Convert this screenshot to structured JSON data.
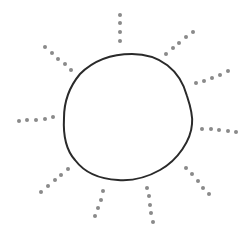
{
  "illustration": {
    "subject": "sun",
    "background": "#ffffff",
    "disc": {
      "stroke": "#2a2a2a",
      "stroke_width": 2,
      "path": "M132,54 C160,54 180,70 187,96 C191,108 193,116 192,124 C191,140 178,160 160,170 C146,178 132,181 118,180 C98,179 84,172 75,160 C66,150 63,136 64,118 C64,100 70,86 80,74 C94,60 112,54 132,54 Z"
    },
    "ray_dot_color": "#8a8a8a",
    "ray_dot_radius": 2,
    "rays": [
      {
        "name": "top",
        "dots": [
          [
            120,
            15
          ],
          [
            120,
            23
          ],
          [
            120,
            32
          ],
          [
            120,
            41
          ]
        ]
      },
      {
        "name": "upper-right",
        "dots": [
          [
            166,
            54
          ],
          [
            173,
            48
          ],
          [
            179,
            43
          ],
          [
            186,
            37
          ],
          [
            193,
            32
          ]
        ]
      },
      {
        "name": "right-upper",
        "dots": [
          [
            196,
            83
          ],
          [
            204,
            81
          ],
          [
            212,
            78
          ],
          [
            220,
            75
          ],
          [
            228,
            71
          ]
        ]
      },
      {
        "name": "right",
        "dots": [
          [
            202,
            129
          ],
          [
            211,
            129
          ],
          [
            219,
            130
          ],
          [
            228,
            131
          ],
          [
            236,
            132
          ]
        ]
      },
      {
        "name": "lower-right",
        "dots": [
          [
            186,
            168
          ],
          [
            192,
            174
          ],
          [
            198,
            181
          ],
          [
            203,
            188
          ],
          [
            209,
            194
          ]
        ]
      },
      {
        "name": "bottom-right",
        "dots": [
          [
            147,
            188
          ],
          [
            149,
            196
          ],
          [
            150,
            205
          ],
          [
            151,
            213
          ],
          [
            153,
            222
          ]
        ]
      },
      {
        "name": "bottom-left",
        "dots": [
          [
            103,
            191
          ],
          [
            101,
            200
          ],
          [
            98,
            208
          ],
          [
            95,
            216
          ]
        ]
      },
      {
        "name": "lower-left",
        "dots": [
          [
            68,
            169
          ],
          [
            61,
            175
          ],
          [
            55,
            180
          ],
          [
            48,
            186
          ],
          [
            41,
            192
          ]
        ]
      },
      {
        "name": "left",
        "dots": [
          [
            19,
            121
          ],
          [
            27,
            120
          ],
          [
            36,
            120
          ],
          [
            45,
            119
          ],
          [
            53,
            117
          ]
        ]
      },
      {
        "name": "upper-left",
        "dots": [
          [
            45,
            47
          ],
          [
            52,
            53
          ],
          [
            58,
            59
          ],
          [
            65,
            64
          ],
          [
            71,
            70
          ]
        ]
      }
    ]
  }
}
